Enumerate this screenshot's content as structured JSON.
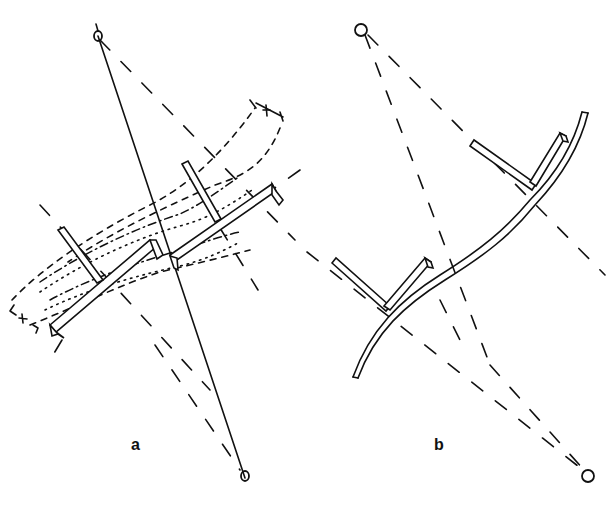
{
  "figure": {
    "panels": [
      {
        "id": "a",
        "label": "a",
        "description": "Rotating beam assembly about two pivots with dashed rotation envelopes",
        "pivots": [
          {
            "name": "top-pivot",
            "x": 98,
            "y": 36
          },
          {
            "name": "bottom-pivot",
            "x": 245,
            "y": 478
          }
        ],
        "envelope_marker": "+"
      },
      {
        "id": "b",
        "label": "b",
        "description": "Curved beam with attached arms and dashed radial lines to two pivots",
        "pivots": [
          {
            "name": "top-pivot",
            "x": 362,
            "y": 31
          },
          {
            "name": "bottom-pivot",
            "x": 588,
            "y": 476
          }
        ]
      }
    ],
    "colors": {
      "ink": "#111111",
      "background": "#ffffff"
    }
  }
}
